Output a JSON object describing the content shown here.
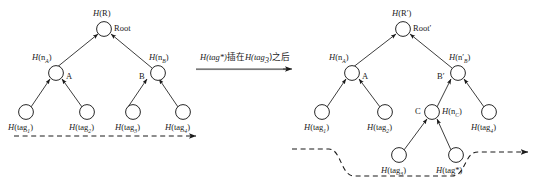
{
  "diagram": {
    "title_fragment": "",
    "transform_text_prefix": "H(tag*)",
    "transform_text_middle": "插在",
    "transform_text_arg": "H(tag",
    "transform_text_sub": "3",
    "transform_text_suffix": ")之后",
    "transform_text_full": "H(tag*)插在H(tag3)之后"
  },
  "left_tree": {
    "name": "original-merkle-tree",
    "root": {
      "hash_label": "H(R)",
      "hash_prefix": "H",
      "hash_inner": "(R)",
      "name_label": "Root"
    },
    "internal_nodes": [
      {
        "hash_prefix": "H",
        "hash_open": "(n",
        "hash_sub": "A",
        "hash_close": ")",
        "name_label": "A"
      },
      {
        "hash_prefix": "H",
        "hash_open": "(n",
        "hash_sub": "B",
        "hash_close": ")",
        "name_label": "B"
      }
    ],
    "leaves": [
      {
        "prefix": "H",
        "open": "(tag",
        "sub": "1",
        "close": ")"
      },
      {
        "prefix": "H",
        "open": "(tag",
        "sub": "2",
        "close": ")"
      },
      {
        "prefix": "H",
        "open": "(tag",
        "sub": "3",
        "close": ")"
      },
      {
        "prefix": "H",
        "open": "(tag",
        "sub": "4",
        "close": ")"
      }
    ]
  },
  "right_tree": {
    "name": "updated-merkle-tree",
    "root": {
      "hash_prefix": "H",
      "hash_inner": "(R′)",
      "name_label": "Root′"
    },
    "internal_nodes": [
      {
        "hash_prefix": "H",
        "hash_open": "(n",
        "hash_sub": "A",
        "hash_close": ")",
        "name_label": "A"
      },
      {
        "hash_prefix": "H",
        "hash_open": "(n′",
        "hash_sub": "B",
        "hash_close": ")",
        "name_label": "B′"
      },
      {
        "hash_prefix": "H",
        "hash_open": "(n",
        "hash_sub": "C",
        "hash_close": ")",
        "name_label": "C"
      }
    ],
    "leaves": [
      {
        "prefix": "H",
        "open": "(tag",
        "sub": "1",
        "close": ")"
      },
      {
        "prefix": "H",
        "open": "(tag",
        "sub": "2",
        "close": ")"
      },
      {
        "prefix": "H",
        "open": "(tag",
        "sub": "4",
        "close": ")"
      },
      {
        "prefix": "H",
        "open": "(tag",
        "sub": "3",
        "close": ")"
      },
      {
        "prefix": "H",
        "open": "(tag*",
        "sub": "",
        "close": ")"
      }
    ]
  },
  "colors": {
    "stroke": "#1a1a1a",
    "background": "#ffffff"
  }
}
